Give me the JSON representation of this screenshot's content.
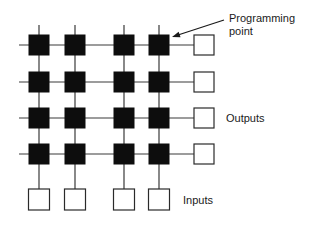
{
  "diagram": {
    "type": "programmable-crossbar-array",
    "grid": {
      "rows": 4,
      "columns": 4,
      "column_x": [
        39,
        75,
        124,
        159
      ],
      "row_y": [
        45,
        82,
        118,
        154
      ],
      "node_size": 21,
      "node_color": "#0d0d0d",
      "line_color": "#3a3a3a"
    },
    "outputs": {
      "count": 4,
      "box_x": 194,
      "box_size": 20
    },
    "inputs": {
      "count": 4,
      "box_y": 189,
      "box_size": 21
    },
    "labels": {
      "programming_point_line1": "Programming",
      "programming_point_line2": "point",
      "outputs": "Outputs",
      "inputs": "Inputs"
    },
    "arrow": {
      "from": [
        224,
        20
      ],
      "to": [
        172,
        37
      ]
    }
  }
}
